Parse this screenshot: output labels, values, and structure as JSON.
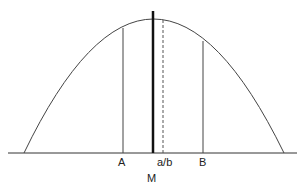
{
  "diagram": {
    "labels": {
      "a": "A",
      "ab": "a/b",
      "b": "B",
      "m": "M"
    },
    "colors": {
      "stroke": "#333333",
      "background": "#ffffff"
    }
  }
}
